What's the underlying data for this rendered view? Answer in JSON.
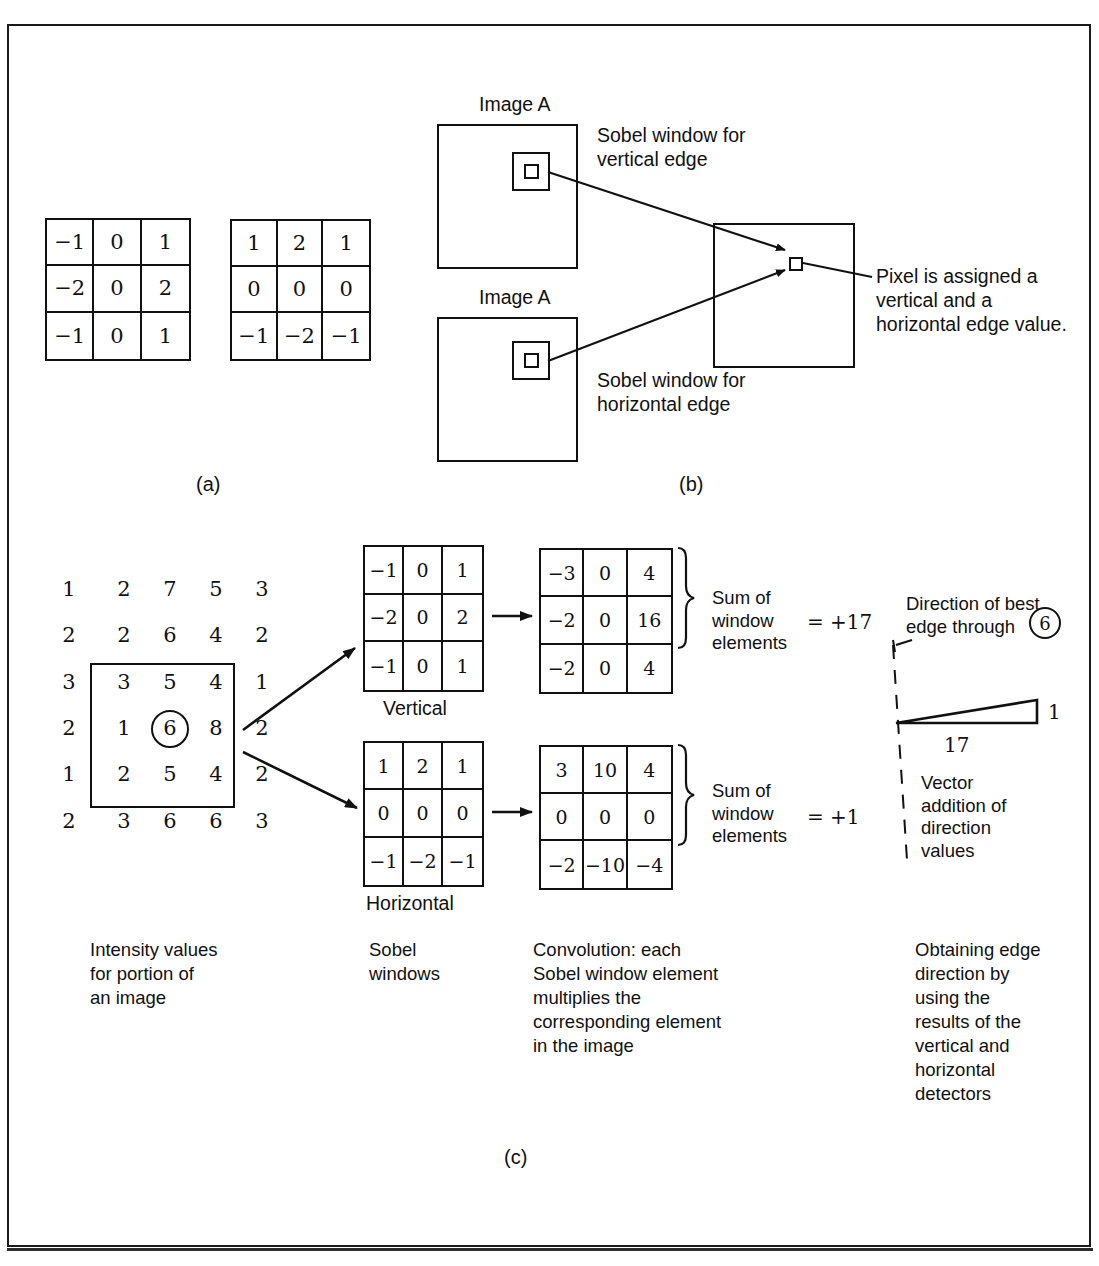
{
  "figure": {
    "panel_labels": {
      "a": "(a)",
      "b": "(b)",
      "c": "(c)"
    }
  },
  "panel_a": {
    "vertical_kernel": {
      "name": "Sobel vertical edge kernel",
      "rows": [
        [
          "−1",
          "0",
          "1"
        ],
        [
          "−2",
          "0",
          "2"
        ],
        [
          "−1",
          "0",
          "1"
        ]
      ]
    },
    "horizontal_kernel": {
      "name": "Sobel horizontal edge kernel",
      "rows": [
        [
          "1",
          "2",
          "1"
        ],
        [
          "0",
          "0",
          "0"
        ],
        [
          "−1",
          "−2",
          "−1"
        ]
      ]
    }
  },
  "panel_b": {
    "image_a_top_label": "Image A",
    "image_a_bottom_label": "Image A",
    "sobel_vertical_caption": "Sobel window for\nvertical edge",
    "sobel_horizontal_caption": "Sobel window for\nhorizontal edge",
    "pixel_caption": "Pixel is assigned a\nvertical  and a\nhorizontal edge value."
  },
  "panel_c": {
    "intensity": {
      "rows": [
        [
          "1",
          "2",
          "7",
          "5",
          "3"
        ],
        [
          "2",
          "2",
          "6",
          "4",
          "2"
        ],
        [
          "3",
          "3",
          "5",
          "4",
          "1"
        ],
        [
          "2",
          "1",
          "6",
          "8",
          "2"
        ],
        [
          "1",
          "2",
          "5",
          "4",
          "2"
        ],
        [
          "2",
          "3",
          "6",
          "6",
          "3"
        ]
      ],
      "center_value": "6"
    },
    "vertical_window": {
      "label": "Vertical",
      "rows": [
        [
          "−1",
          "0",
          "1"
        ],
        [
          "−2",
          "0",
          "2"
        ],
        [
          "−1",
          "0",
          "1"
        ]
      ]
    },
    "horizontal_window": {
      "label": "Horizontal",
      "rows": [
        [
          "1",
          "2",
          "1"
        ],
        [
          "0",
          "0",
          "0"
        ],
        [
          "−1",
          "−2",
          "−1"
        ]
      ]
    },
    "vertical_result": {
      "rows": [
        [
          "−3",
          "0",
          "4"
        ],
        [
          "−2",
          "0",
          "16"
        ],
        [
          "−2",
          "0",
          "4"
        ]
      ]
    },
    "horizontal_result": {
      "rows": [
        [
          "3",
          "10",
          "4"
        ],
        [
          "0",
          "0",
          "0"
        ],
        [
          "−2",
          "−10",
          "−4"
        ]
      ]
    },
    "sum_label_vertical": "Sum of\nwindow\nelements",
    "sum_label_horizontal": "Sum of\nwindow\nelements",
    "sum_equals_vertical": "=  +17",
    "sum_equals_horizontal": "=  +1",
    "direction_caption": "Direction of best\nedge  through",
    "direction_circle_value": "6",
    "vector_horizontal_value": "17",
    "vector_vertical_value": "1",
    "vector_caption": "Vector\naddition of\ndirection\nvalues",
    "captions": {
      "intensity": "Intensity values\nfor portion of\nan image",
      "windows": "Sobel\nwindows",
      "convolution": "Convolution: each\nSobel window element\nmultiplies the\ncorresponding element\nin the image",
      "direction": "Obtaining edge\ndirection by\nusing the\nresults of the\nvertical and\nhorizontal\ndetectors"
    }
  },
  "colors": {
    "ink": "#111111",
    "paper": "#ffffff"
  }
}
